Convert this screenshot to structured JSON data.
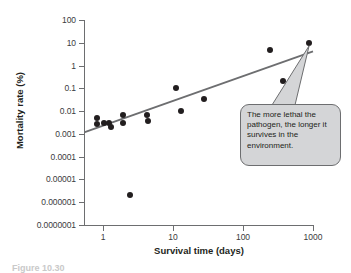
{
  "chart_data": {
    "type": "scatter",
    "title": "",
    "xlabel": "Survival time (days)",
    "ylabel": "Mortality rate (%)",
    "xscale": "log",
    "yscale": "log",
    "xlim": [
      0.55,
      1600
    ],
    "ylim": [
      1e-07,
      100
    ],
    "grid": false,
    "legend": null,
    "xticks": [
      "1",
      "10",
      "100",
      "1000"
    ],
    "xtick_values": [
      1,
      10,
      100,
      1000
    ],
    "yticks": [
      "100",
      "10",
      "1",
      "0.1",
      "0.01",
      "0.001",
      "0.0001",
      "0.00001",
      "0.000001",
      "0.0000001"
    ],
    "ytick_values": [
      100,
      10,
      1,
      0.1,
      0.01,
      0.001,
      0.0001,
      1e-05,
      1e-06,
      1e-07
    ],
    "points": [
      {
        "x": 0.82,
        "y": 0.0052
      },
      {
        "x": 0.83,
        "y": 0.0026
      },
      {
        "x": 1.05,
        "y": 0.0031
      },
      {
        "x": 1.2,
        "y": 0.003
      },
      {
        "x": 1.3,
        "y": 0.002
      },
      {
        "x": 1.9,
        "y": 0.0065
      },
      {
        "x": 1.95,
        "y": 0.003
      },
      {
        "x": 2.4,
        "y": 2e-06
      },
      {
        "x": 4.3,
        "y": 0.0067
      },
      {
        "x": 4.4,
        "y": 0.0038
      },
      {
        "x": 11.0,
        "y": 0.1
      },
      {
        "x": 13.0,
        "y": 0.0098
      },
      {
        "x": 28.0,
        "y": 0.035
      },
      {
        "x": 240.0,
        "y": 5.0
      },
      {
        "x": 370.0,
        "y": 0.2
      },
      {
        "x": 880.0,
        "y": 10.0
      }
    ],
    "trend_line": {
      "label": "regression line",
      "color": "#6d6e70",
      "start": {
        "x": 0.55,
        "y": 0.0012
      },
      "end": {
        "x": 1000.0,
        "y": 4.2
      }
    },
    "annotations": [
      {
        "name": "callout",
        "text": "The more lethal the pathogen, the longer it survives in the environment.",
        "anchor": {
          "x": 880.0,
          "y": 10.0
        },
        "background": "#d4d5d7",
        "border": "#6d6e70"
      }
    ]
  },
  "axes": {
    "y_title": "Mortality rate (%)",
    "x_title": "Survival time (days)",
    "y_labels": [
      "100",
      "10",
      "1",
      "0.1",
      "0.01",
      "0.001",
      "0.0001",
      "0.00001",
      "0.000001",
      "0.0000001"
    ],
    "x_labels": [
      "1",
      "10",
      "100",
      "1000"
    ]
  },
  "callout": {
    "text": "The more lethal the pathogen, the longer it survives in the environment."
  },
  "caption": {
    "text": "Figure 10.30"
  },
  "colors": {
    "point": "#221e1f",
    "axis": "#6d6e70",
    "callout_fill": "#d4d5d7",
    "text": "#231f20"
  }
}
